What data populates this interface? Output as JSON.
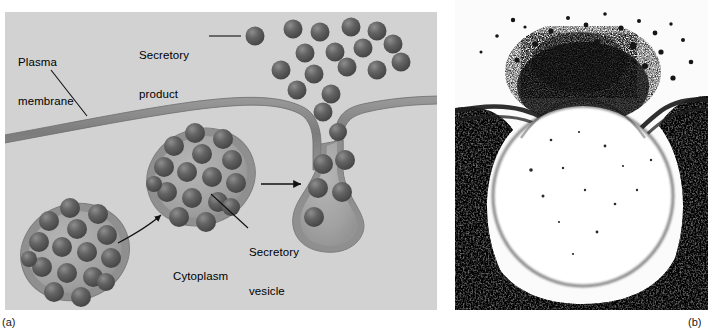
{
  "figure": {
    "panels": [
      {
        "letter": "(a)",
        "kind": "diagram",
        "title": "Exocytosis of secretory vesicles through the plasma membrane",
        "labels": [
          {
            "name": "plasma-membrane",
            "text": "Plasma\nmembrane"
          },
          {
            "name": "secretory-product",
            "text": "Secretory\nproduct"
          },
          {
            "name": "secretory-vesicle",
            "text": "Secretory\nvesicle"
          },
          {
            "name": "cytoplasm",
            "text": "Cytoplasm"
          }
        ],
        "colors": {
          "background": "#d2d2d2",
          "membrane": "#8c8c8c",
          "membrane_edge": "#6e6e6e",
          "vesicle_fill": "#a8a8a8",
          "vesicle_ring": "#8f8f8f",
          "granule": "#5a5a5a",
          "granule_highlight": "#9a9a9a",
          "leader": "#1a1a1a"
        },
        "counts": {
          "granules_vesicle_left": 16,
          "granules_vesicle_middle": 16,
          "granules_vesicle_fusing": 6,
          "granules_released": 16
        }
      },
      {
        "letter": "(b)",
        "kind": "electron-micrograph",
        "title": "Electron micrograph of a secretory vesicle fused with the plasma membrane",
        "colors": {
          "background": "#f7f7f7",
          "dense": "#141414",
          "lumen": "#ffffff"
        }
      }
    ]
  },
  "labels_text": {
    "plasma_membrane_1": "Plasma",
    "plasma_membrane_2": "membrane",
    "secretory_product_1": "Secretory",
    "secretory_product_2": "product",
    "secretory_vesicle_1": "Secretory",
    "secretory_vesicle_2": "vesicle",
    "cytoplasm": "Cytoplasm",
    "panel_a_letter": "(a)",
    "panel_b_letter": "(b)"
  }
}
